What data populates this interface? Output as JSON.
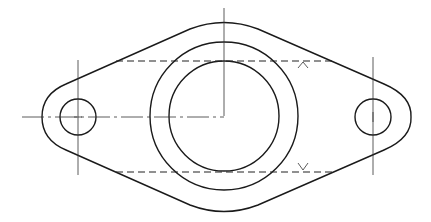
{
  "drawing": {
    "type": "flange-plate-top-view",
    "colors": {
      "background": "#ffffff",
      "line": "#1a1a1a"
    },
    "main_boss": {
      "center": [
        224,
        116
      ],
      "inner_bore_radius": 55,
      "boss_outer_radius": 74
    },
    "holes": [
      {
        "name": "left-bolt-hole",
        "center": [
          78,
          117
        ],
        "radius": 18,
        "lug_radius": 36
      },
      {
        "name": "right-bolt-hole",
        "center": [
          373,
          117
        ],
        "radius": 18,
        "lug_radius": 38
      }
    ],
    "hidden_lines": [
      {
        "y": 61,
        "x_start": 116,
        "x_end": 333
      },
      {
        "y": 172,
        "x_start": 116,
        "x_end": 333
      }
    ],
    "section_marks": [
      {
        "symbol": "^",
        "x": 303,
        "y": 66
      },
      {
        "symbol": "v",
        "x": 303,
        "y": 165
      }
    ]
  }
}
